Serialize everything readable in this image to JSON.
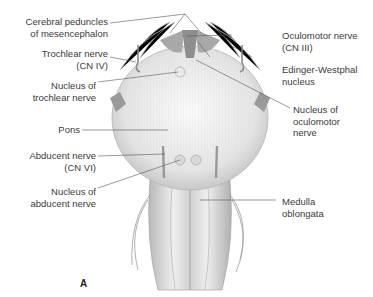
{
  "figure": {
    "panel_letter": "A",
    "labels_left": [
      {
        "id": "cerebral-peduncles",
        "text": "Cerebral peduncles\nof mesencephalon"
      },
      {
        "id": "trochlear-nerve",
        "text": "Trochlear nerve\n(CN IV)"
      },
      {
        "id": "nucleus-trochlear",
        "text": "Nucleus of\ntrochlear nerve"
      },
      {
        "id": "pons",
        "text": "Pons"
      },
      {
        "id": "abducent-nerve",
        "text": "Abducent nerve\n(CN VI)"
      },
      {
        "id": "nucleus-abducent",
        "text": "Nucleus of\nabducent nerve"
      }
    ],
    "labels_right": [
      {
        "id": "oculomotor-nerve",
        "text": "Oculomotor nerve\n(CN III)"
      },
      {
        "id": "edinger-westphal",
        "text": "Edinger-Westphal\nnucleus"
      },
      {
        "id": "nucleus-oculomotor",
        "text": "Nucleus of\noculomotor\nnerve"
      },
      {
        "id": "medulla",
        "text": "Medulla\noblongata"
      }
    ],
    "colors": {
      "line": "#555555",
      "tissue": "#d6d6d6",
      "tissue_dark": "#9a9a9a",
      "text": "#3a3a3a"
    }
  }
}
